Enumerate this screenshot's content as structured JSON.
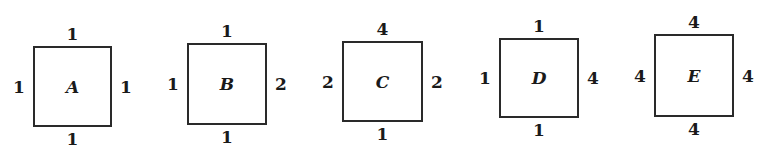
{
  "figure": {
    "squares": [
      {
        "name": "A",
        "box": {
          "left": 33,
          "top": 46,
          "right": 112,
          "bottom": 127
        },
        "labels": {
          "top": "1",
          "bottom": "1",
          "left": "1",
          "right": "1"
        }
      },
      {
        "name": "B",
        "box": {
          "left": 187,
          "top": 43,
          "right": 267,
          "bottom": 125
        },
        "labels": {
          "top": "1",
          "bottom": "1",
          "left": "1",
          "right": "2"
        }
      },
      {
        "name": "C",
        "box": {
          "left": 342,
          "top": 41,
          "right": 423,
          "bottom": 122
        },
        "labels": {
          "top": "4",
          "bottom": "1",
          "left": "2",
          "right": "2"
        }
      },
      {
        "name": "D",
        "box": {
          "left": 499,
          "top": 38,
          "right": 579,
          "bottom": 118
        },
        "labels": {
          "top": "1",
          "bottom": "1",
          "left": "1",
          "right": "4"
        }
      },
      {
        "name": "E",
        "box": {
          "left": 654,
          "top": 34,
          "right": 734,
          "bottom": 117
        },
        "labels": {
          "top": "4",
          "bottom": "4",
          "left": "4",
          "right": "4"
        }
      }
    ]
  }
}
